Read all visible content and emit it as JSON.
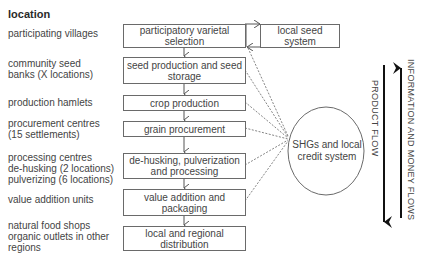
{
  "diagram": {
    "heading": "location",
    "locations": [
      {
        "label": "participating villages"
      },
      {
        "label": "community seed\nbanks (X locations)"
      },
      {
        "label": "production hamlets"
      },
      {
        "label": "procurement centres\n(15 settlements)"
      },
      {
        "label": "processing centres\nde-husking (2 locations)\npulverizing (6 locations)"
      },
      {
        "label": "value addition units"
      },
      {
        "label": "natural food shops\norganic outlets in other\nregions"
      }
    ],
    "steps": [
      {
        "label": "participatory varietal\nselection"
      },
      {
        "label": "seed production and seed\nstorage"
      },
      {
        "label": "crop production"
      },
      {
        "label": "grain procurement"
      },
      {
        "label": "de-husking, pulverization\nand processing"
      },
      {
        "label": "value addition and\npackaging"
      },
      {
        "label": "local and regional\ndistribution"
      }
    ],
    "side_box": {
      "label": "local seed\nsystem"
    },
    "hub": {
      "label": "SHGs and local\ncredit system"
    },
    "flows": {
      "product": "PRODUCT FLOW",
      "information": "INFORMATION AND MONEY FLOWS"
    },
    "colors": {
      "line": "#6a6a6a",
      "arrow": "#1a1a1a",
      "text": "#444444"
    }
  }
}
